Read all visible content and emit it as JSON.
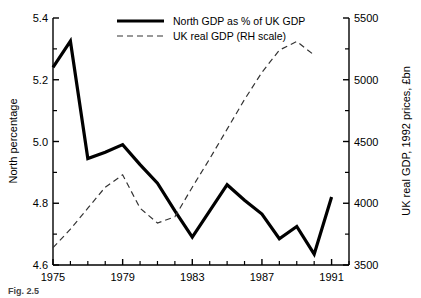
{
  "chart_data": {
    "type": "line",
    "title": "",
    "xlabel": "",
    "xlim": [
      1975,
      1992
    ],
    "x_tick_labels": [
      "1975",
      "1979",
      "1983",
      "1987",
      "1991"
    ],
    "x_tick_values": [
      1975,
      1979,
      1983,
      1987,
      1991
    ],
    "x_minor_tick_values": [
      1976,
      1977,
      1978,
      1980,
      1981,
      1982,
      1984,
      1985,
      1986,
      1988,
      1989,
      1990,
      1992
    ],
    "grid": false,
    "legend_position": "top-center",
    "axes": [
      {
        "id": "left",
        "ylabel": "North percentage",
        "ylim": [
          4.6,
          5.4
        ],
        "y_tick_labels": [
          "4.6",
          "4.8",
          "5.0",
          "5.2",
          "5.4"
        ],
        "y_tick_values": [
          4.6,
          4.8,
          5.0,
          5.2,
          5.4
        ],
        "y_minor_tick_values": [
          4.7,
          4.9,
          5.1,
          5.3
        ]
      },
      {
        "id": "right",
        "ylabel": "UK real GDP, 1992 prices, £bn",
        "ylim": [
          3500,
          5500
        ],
        "y_tick_labels": [
          "3500",
          "4000",
          "4500",
          "5000",
          "5500"
        ],
        "y_tick_values": [
          3500,
          4000,
          4500,
          5000,
          5500
        ],
        "y_minor_tick_values": [
          3750,
          4250,
          4750,
          5250
        ]
      }
    ],
    "x": [
      1975,
      1976,
      1977,
      1978,
      1979,
      1980,
      1981,
      1982,
      1983,
      1984,
      1985,
      1986,
      1987,
      1988,
      1989,
      1990,
      1991,
      1992
    ],
    "series": [
      {
        "name": "North GDP as % of UK GDP",
        "axis": "left",
        "style": "solid",
        "color": "#000000",
        "line_width": 3.2,
        "x": [
          1975,
          1976,
          1977,
          1978,
          1979,
          1980,
          1981,
          1982,
          1983,
          1984,
          1985,
          1986,
          1987,
          1988,
          1989,
          1990,
          1991,
          1992
        ],
        "values": [
          5.24,
          5.325,
          4.945,
          4.965,
          4.99,
          4.925,
          4.865,
          4.775,
          4.69,
          4.775,
          4.86,
          4.81,
          4.765,
          4.685,
          4.725,
          4.635,
          4.82,
          null
        ]
      },
      {
        "name": "UK real GDP (RH scale)",
        "axis": "right",
        "style": "dashed",
        "color": "#333333",
        "line_width": 1.2,
        "x": [
          1975,
          1976,
          1977,
          1978,
          1979,
          1980,
          1981,
          1982,
          1983,
          1984,
          1985,
          1986,
          1987,
          1988,
          1989,
          1990
        ],
        "values": [
          3640,
          3790,
          3960,
          4130,
          4230,
          3960,
          3840,
          3890,
          4130,
          4360,
          4600,
          4840,
          5060,
          5240,
          5310,
          5200
        ]
      }
    ],
    "legend": [
      {
        "label": "North GDP as % of UK GDP",
        "style": "solid",
        "color": "#000000"
      },
      {
        "label": "UK real GDP (RH scale)",
        "style": "dashed",
        "color": "#333333"
      }
    ],
    "annotations": []
  },
  "caption": {
    "text": "Fig. 2.5"
  }
}
